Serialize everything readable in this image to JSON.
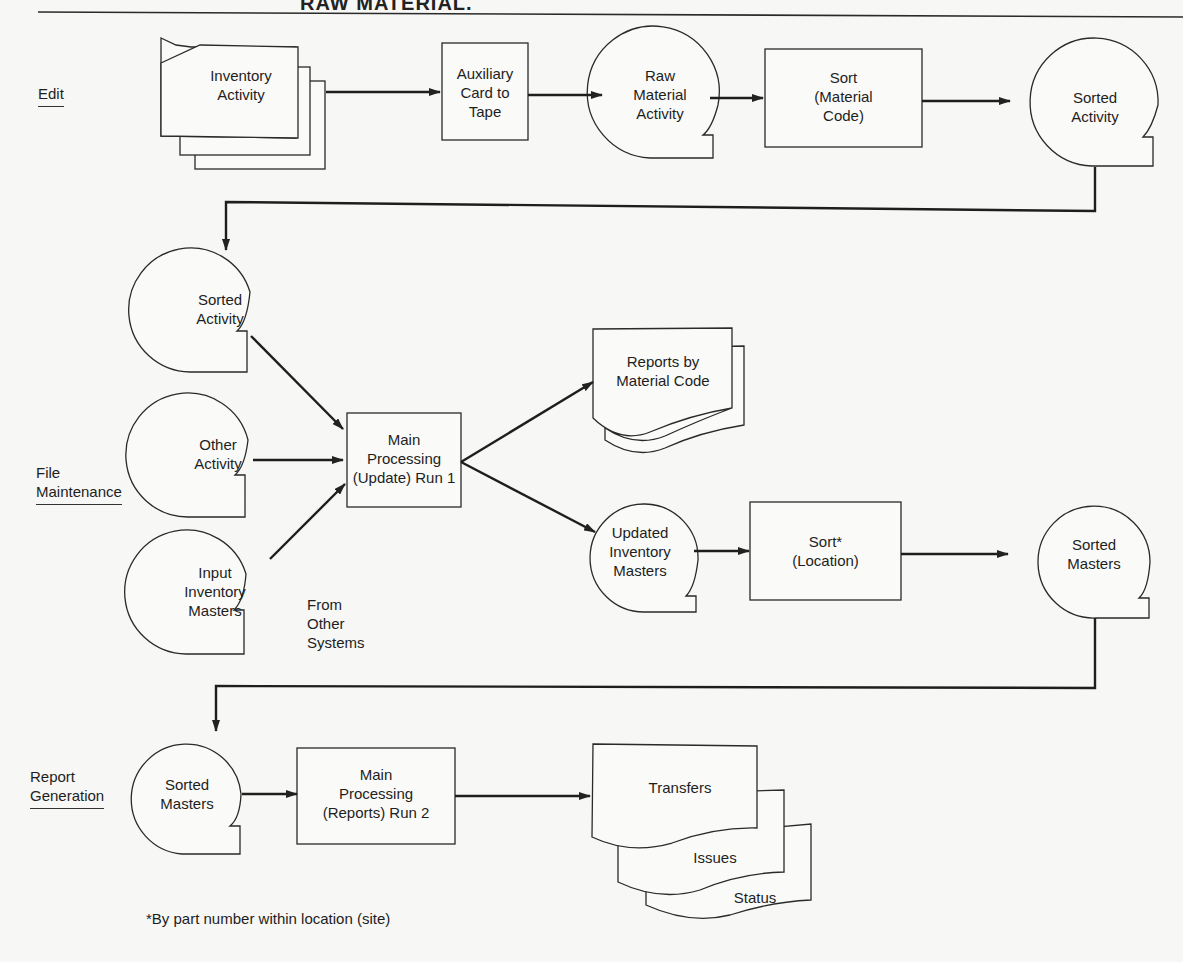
{
  "title_fragment": "RAW MATERIAL.",
  "sections": {
    "edit": "Edit",
    "file_maintenance_1": "File",
    "file_maintenance_2": "Maintenance",
    "report_generation_1": "Report",
    "report_generation_2": "Generation"
  },
  "nodes": {
    "inventory_activity": [
      "Inventory",
      "Activity"
    ],
    "auxiliary_card": [
      "Auxiliary",
      "Card to",
      "Tape"
    ],
    "raw_material_activity": [
      "Raw",
      "Material",
      "Activity"
    ],
    "sort_material_code": [
      "Sort",
      "(Material",
      "Code)"
    ],
    "sorted_activity_top": [
      "Sorted",
      "Activity"
    ],
    "sorted_activity": [
      "Sorted",
      "Activity"
    ],
    "other_activity": [
      "Other",
      "Activity"
    ],
    "input_inventory_masters": [
      "Input",
      "Inventory",
      "Masters"
    ],
    "main_processing_1": [
      "Main",
      "Processing",
      "(Update) Run 1"
    ],
    "reports_by_material_code": [
      "Reports by",
      "Material Code"
    ],
    "updated_inventory_masters": [
      "Updated",
      "Inventory",
      "Masters"
    ],
    "sort_location": [
      "Sort*",
      "(Location)"
    ],
    "sorted_masters_right": [
      "Sorted",
      "Masters"
    ],
    "sorted_masters": [
      "Sorted",
      "Masters"
    ],
    "main_processing_2": [
      "Main",
      "Processing",
      "(Reports) Run 2"
    ],
    "transfers": "Transfers",
    "issues": "Issues",
    "status": "Status"
  },
  "annotations": {
    "from_other_systems": [
      "From",
      "Other",
      "Systems"
    ],
    "footnote": "*By part number within location (site)"
  },
  "colors": {
    "line": "#2a2a2a",
    "background": "#f7f7f5"
  }
}
